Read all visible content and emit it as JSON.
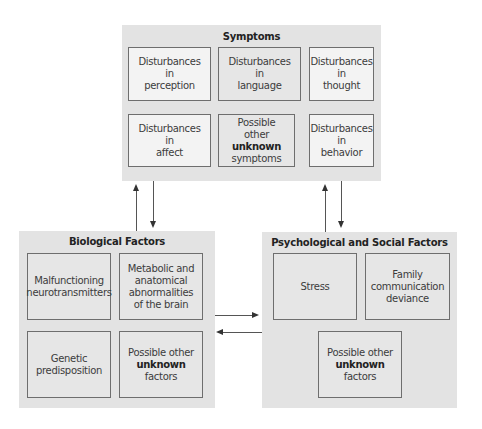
{
  "symptoms": {
    "title": "Symptoms",
    "cells": [
      {
        "lines": [
          "Disturbances",
          "in",
          "perception"
        ]
      },
      {
        "lines": [
          "Disturbances",
          "in",
          "language"
        ]
      },
      {
        "lines": [
          "Disturbances",
          "in",
          "thought"
        ]
      },
      {
        "lines": [
          "Disturbances",
          "in",
          "affect"
        ]
      },
      {
        "line1": "Possible",
        "line2_pre": "other ",
        "line2_bold": "unknown",
        "line3": "symptoms"
      },
      {
        "lines": [
          "Disturbances",
          "in",
          "behavior"
        ]
      }
    ]
  },
  "biological": {
    "title": "Biological Factors",
    "cells": [
      {
        "lines": [
          "Malfunctioning",
          "neurotransmitters"
        ]
      },
      {
        "lines": [
          "Metabolic and",
          "anatomical",
          "abnormalities",
          "of the brain"
        ]
      },
      {
        "lines": [
          "Genetic",
          "predisposition"
        ]
      },
      {
        "line1": "Possible other",
        "line2_bold": "unknown",
        "line3": "factors"
      }
    ]
  },
  "psychosocial": {
    "title": "Psychological and Social Factors",
    "cells": [
      {
        "lines": [
          "Stress"
        ]
      },
      {
        "lines": [
          "Family",
          "communication",
          "deviance"
        ]
      },
      {
        "line1": "Possible other",
        "line2_bold": "unknown",
        "line3": "factors"
      }
    ]
  },
  "colors": {
    "group_bg": "#e3e3e3",
    "cell_light": "#f3f3f3",
    "cell_mid": "#e6e6e6",
    "border": "#6e6e6e",
    "arrow": "#333333"
  }
}
